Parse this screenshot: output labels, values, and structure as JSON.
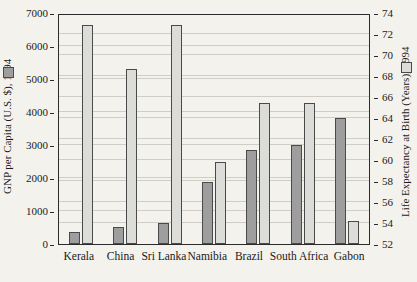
{
  "chart_data": {
    "type": "bar",
    "title": "",
    "categories": [
      "Kerala",
      "China",
      "Sri Lanka",
      "Namibia",
      "Brazil",
      "South Africa",
      "Gabon"
    ],
    "series": [
      {
        "name": "GNP per Capita (U.S. $), 1994",
        "axis": "left",
        "color": "#9e9e9e",
        "values": [
          370,
          530,
          640,
          1870,
          2840,
          2990,
          3820
        ]
      },
      {
        "name": "Life Expectancy at Birth (Years), 1994",
        "axis": "right",
        "color": "#dcdcd8",
        "values": [
          72.9,
          68.7,
          72.9,
          59.8,
          65.4,
          65.4,
          54.2
        ]
      }
    ],
    "xlabel": "",
    "ylabel": "GNP per Capita (U.S. $), 1994",
    "y2label": "Life Expectancy at Birth (Years), 1994",
    "ylim": [
      0,
      7000
    ],
    "y2lim": [
      52,
      74
    ],
    "yticks": [
      "0",
      "1000",
      "2000",
      "3000",
      "4000",
      "5000",
      "6000",
      "7000"
    ],
    "y2ticks": [
      "52",
      "54",
      "56",
      "58",
      "60",
      "62",
      "64",
      "66",
      "68",
      "70",
      "72",
      "74"
    ],
    "grid": true,
    "legend_position": "axis-titles"
  },
  "axes": {
    "left_title": "GNP per Capita (U.S. $), 1994",
    "right_title": "Life Expectancy at Birth (Years), 1994"
  },
  "icons": {
    "gnp_swatch": "legend-swatch-gnp",
    "life_swatch": "legend-swatch-life-expectancy"
  }
}
